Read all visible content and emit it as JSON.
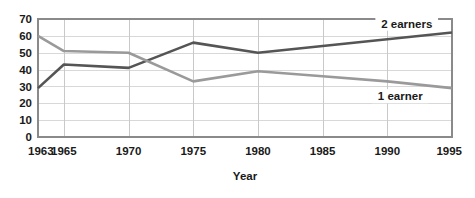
{
  "chart_data": {
    "type": "line",
    "title": "",
    "xlabel": "Year",
    "ylabel": "",
    "x": [
      1963,
      1965,
      1970,
      1975,
      1980,
      1985,
      1990,
      1995
    ],
    "xtick_labels": [
      "1963",
      "1965",
      "1970",
      "1975",
      "1980",
      "1985",
      "1990",
      "1995"
    ],
    "ytick_labels": [
      "0",
      "10",
      "20",
      "30",
      "40",
      "50",
      "60",
      "70"
    ],
    "yticks": [
      0,
      10,
      20,
      30,
      40,
      50,
      60,
      70
    ],
    "ylim": [
      0,
      70
    ],
    "xlim": [
      1963,
      1995
    ],
    "grid": "horizontal-and-vertical",
    "legend_position": "inline-right-end-of-line",
    "series": [
      {
        "name": "2 earners",
        "label": "2 earners",
        "color": "#555555",
        "values": [
          29,
          43,
          41,
          56,
          50,
          54,
          58,
          62
        ]
      },
      {
        "name": "1 earner",
        "label": "1 earner",
        "color": "#9a9a9a",
        "values": [
          60,
          51,
          50,
          33,
          39,
          36,
          33,
          29
        ]
      }
    ],
    "annotations": [
      {
        "text": "2 earners",
        "x": 1991.5,
        "y": 66
      },
      {
        "text": "1 earner",
        "x": 1991.0,
        "y": 23
      }
    ]
  },
  "colors": {
    "series_2_earners": "#555555",
    "series_1_earner": "#9a9a9a",
    "gridline": "#d8d8d8",
    "frame": "#8a8a8a",
    "text": "#1a1a1a",
    "background": "#ffffff"
  }
}
